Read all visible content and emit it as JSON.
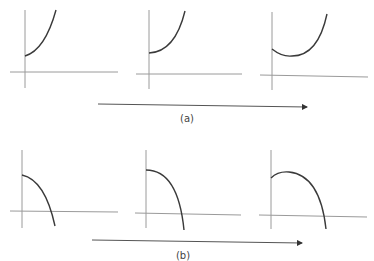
{
  "rows": [
    {
      "label": "(a)",
      "description": "Increasing curve evolving: starts convex rising, then develops a minimum",
      "panels": [
        {
          "name": "a1",
          "shape": "convex increasing from positive intercept"
        },
        {
          "name": "a2",
          "shape": "convex increasing, flatter start"
        },
        {
          "name": "a3",
          "shape": "dips to a minimum then rises"
        }
      ]
    },
    {
      "label": "(b)",
      "description": "Decreasing curve evolving: starts concave falling, then develops a maximum",
      "panels": [
        {
          "name": "b1",
          "shape": "concave decreasing crossing x-axis"
        },
        {
          "name": "b2",
          "shape": "concave decreasing, flatter start"
        },
        {
          "name": "b3",
          "shape": "rises to a maximum then falls crossing x-axis"
        }
      ]
    }
  ],
  "colors": {
    "axis": "#9a9a9a",
    "curve": "#3a3a3a",
    "arrow": "#555555"
  }
}
